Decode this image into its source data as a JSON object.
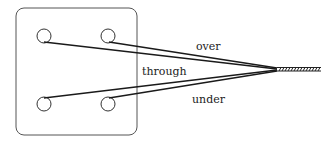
{
  "diagram": {
    "labels": {
      "over": "over",
      "through": "through",
      "under": "under"
    },
    "colors": {
      "stroke": "#1a1a1a",
      "box_stroke": "#555555",
      "background": "#ffffff"
    }
  }
}
